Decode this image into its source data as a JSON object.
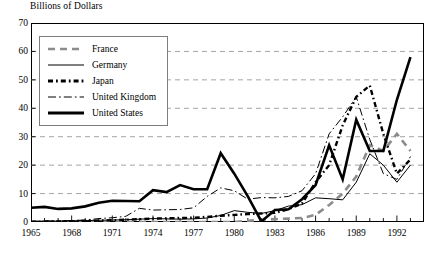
{
  "chart_data": {
    "type": "line",
    "title": "Billions of Dollars",
    "xlabel": "",
    "ylabel": "Billions of Dollars",
    "ylim": [
      0,
      70
    ],
    "xlim": [
      1965,
      1994
    ],
    "ytick_labels": [
      "0",
      "10",
      "20",
      "30",
      "40",
      "50",
      "60",
      "70"
    ],
    "ytick_values": [
      0,
      10,
      20,
      30,
      40,
      50,
      60,
      70
    ],
    "xtick_labels": [
      "1965",
      "1968",
      "1971",
      "1974",
      "1977",
      "1980",
      "1983",
      "1986",
      "1989",
      "1992"
    ],
    "xtick_values": [
      1965,
      1968,
      1971,
      1974,
      1977,
      1980,
      1983,
      1986,
      1989,
      1992
    ],
    "grid": "horizontal-dashed-gray",
    "minor_xticks": "annual",
    "legend_position": "upper-left-inside",
    "x": [
      1965,
      1966,
      1967,
      1968,
      1969,
      1970,
      1971,
      1972,
      1973,
      1974,
      1975,
      1976,
      1977,
      1978,
      1979,
      1980,
      1981,
      1982,
      1983,
      1984,
      1985,
      1986,
      1987,
      1988,
      1989,
      1990,
      1991,
      1992,
      1993
    ],
    "series": [
      {
        "name": "France",
        "color": "#8c8c8c",
        "style": "dashed",
        "width": 2.6,
        "values": [
          0,
          0,
          0,
          0,
          0,
          0,
          0,
          0,
          0,
          0,
          0,
          0,
          0,
          0,
          0,
          0,
          0.4,
          0.8,
          1.0,
          1.2,
          1.4,
          2.5,
          6.0,
          10.0,
          16.0,
          27.0,
          25.0,
          31.0,
          25.0
        ]
      },
      {
        "name": "Germany",
        "color": "#000000",
        "style": "solid",
        "width": 1.0,
        "values": [
          0.2,
          0.3,
          0.3,
          0.4,
          0.5,
          0.6,
          0.7,
          0.8,
          1.0,
          1.2,
          1.1,
          1.0,
          1.1,
          1.4,
          2.3,
          4.0,
          3.4,
          3.0,
          4.0,
          5.6,
          6.1,
          8.5,
          8.2,
          7.8,
          14.0,
          24.0,
          20.0,
          14.0,
          20.0
        ]
      },
      {
        "name": "Japan",
        "color": "#000000",
        "style": "dashdot-bold",
        "width": 2.4,
        "values": [
          0.1,
          0.15,
          0.2,
          0.3,
          0.4,
          0.5,
          0.6,
          0.8,
          1.0,
          1.2,
          1.3,
          1.4,
          1.5,
          1.8,
          2.2,
          2.5,
          2.8,
          3.0,
          3.2,
          4.5,
          6.5,
          14.0,
          20.0,
          34.0,
          44.0,
          48.0,
          31.0,
          17.0,
          22.0
        ]
      },
      {
        "name": "United Kingdom",
        "color": "#000000",
        "style": "dashdot-thin",
        "width": 1.0,
        "values": [
          0.2,
          0.3,
          0.4,
          0.5,
          0.7,
          1.2,
          1.5,
          2.0,
          4.8,
          4.2,
          4.3,
          4.4,
          5.0,
          9.0,
          12.0,
          11.0,
          8.0,
          8.6,
          8.5,
          9.0,
          11.0,
          17.0,
          31.0,
          37.0,
          44.0,
          29.0,
          17.0,
          15.0,
          23.0
        ]
      },
      {
        "name": "United States",
        "color": "#000000",
        "style": "solid-bold",
        "width": 2.6,
        "values": [
          5.0,
          5.3,
          4.6,
          4.8,
          5.5,
          6.8,
          7.5,
          7.4,
          7.3,
          11.2,
          10.5,
          13.0,
          11.5,
          11.5,
          24.2,
          17.0,
          9.0,
          0.2,
          4.2,
          4.5,
          8.0,
          13.0,
          27.0,
          15.0,
          36.0,
          25.0,
          25.0,
          43.0,
          58.0
        ]
      }
    ]
  },
  "legend": {
    "items": [
      {
        "label": "France",
        "swatch": "gray-dashed-swatch"
      },
      {
        "label": "Germany",
        "swatch": "thin-solid-swatch"
      },
      {
        "label": "Japan",
        "swatch": "bold-dashdot-swatch"
      },
      {
        "label": "United Kingdom",
        "swatch": "thin-dashdot-swatch"
      },
      {
        "label": "United States",
        "swatch": "bold-solid-swatch"
      }
    ]
  },
  "colors": {
    "axis": "#000000",
    "grid": "#9a9a9a",
    "france": "#8c8c8c",
    "series_black": "#000000",
    "background": "#ffffff"
  }
}
